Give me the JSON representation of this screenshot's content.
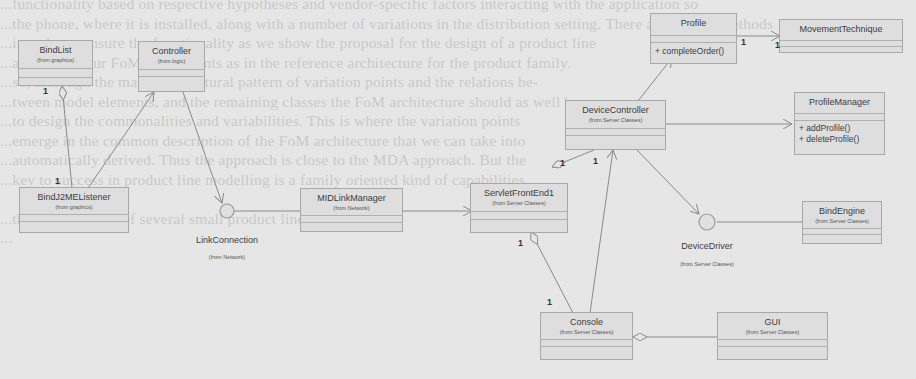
{
  "background_text_lines": [
    "...functionality based on respective hypotheses and vendor-specific factors interacting with the application so",
    "...the phone, where it is installed, along with a number of variations in the distribution setting. There are several methods",
    "...in order to ensure the functionality as we show the proposal for the design of a product line",
    "...analysis of our FoM components as in the reference architecture for the product family.",
    "...so, although the main architectural pattern of variation points and the relations be-",
    "...tween model elements, and the remaining classes the FoM architecture should as well be",
    "...to design the commonalities and variabilities. This is where the variation points",
    "...emerge in the common description of the FoM architecture that we can take into",
    "...automatically derived. Thus the approach is close to the MDA approach. But the",
    "...key to success in product line modelling is a family oriented kind of capabilities",
    "",
    "...the development of several small product lines",
    "..."
  ],
  "classes": [
    {
      "id": "bindlist",
      "name": "BindList",
      "package": "(from graphics)",
      "operations": []
    },
    {
      "id": "controller",
      "name": "Controller",
      "package": "(from logic)",
      "operations": []
    },
    {
      "id": "bindj2me",
      "name": "BindJ2MEListener",
      "package": "(from graphics)",
      "operations": []
    },
    {
      "id": "midlink",
      "name": "MIDLinkManager",
      "package": "(from Network)",
      "operations": []
    },
    {
      "id": "servlet",
      "name": "ServletFrontEnd1",
      "package": "(from Server Classes)",
      "operations": []
    },
    {
      "id": "profile",
      "name": "Profile",
      "package": "",
      "operations": [
        "+ completeOrder()"
      ]
    },
    {
      "id": "movement",
      "name": "MovementTechnique",
      "package": "",
      "operations": []
    },
    {
      "id": "devicectl",
      "name": "DeviceController",
      "package": "(from Server Classes)",
      "operations": []
    },
    {
      "id": "profilemgr",
      "name": "ProfileManager",
      "package": "",
      "operations": [
        "+ addProfile()",
        "+ deleteProfile()"
      ]
    },
    {
      "id": "bindengine",
      "name": "BindEngine",
      "package": "(from Server Classes)",
      "operations": []
    },
    {
      "id": "console",
      "name": "Console",
      "package": "(from Server Classes)",
      "operations": []
    },
    {
      "id": "gui",
      "name": "GUI",
      "package": "(from Server Classes)",
      "operations": []
    }
  ],
  "interfaces": [
    {
      "id": "linkconn",
      "name": "LinkConnection",
      "package": "(from Network)"
    },
    {
      "id": "devicedrv",
      "name": "DeviceDriver",
      "package": "(from Server Classes)"
    }
  ],
  "multiplicities": {
    "bindlist_bottom": "1",
    "bindj2me_top": "1",
    "profile_right": "1",
    "movement_left": "1",
    "devicectl_bottom": "1",
    "servlet_top": "1",
    "servlet_bottom": "1",
    "console_top": "1"
  }
}
